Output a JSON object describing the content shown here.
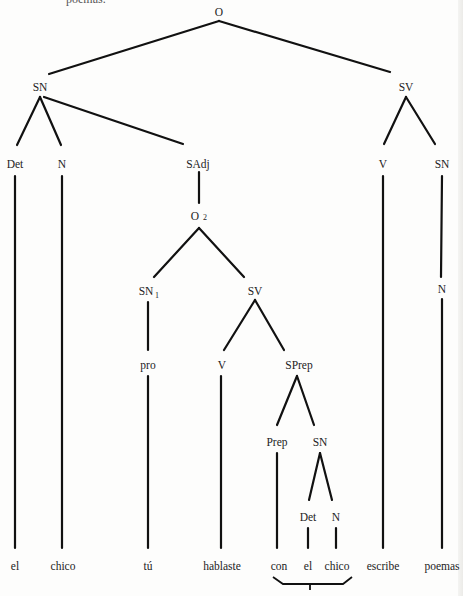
{
  "diagram": {
    "type": "syntax-tree",
    "top_fragment": "poemas.",
    "nodes": {
      "root": {
        "label": "O",
        "x": 219,
        "y": 14
      },
      "sn_main": {
        "label": "SN",
        "x": 40,
        "y": 88
      },
      "sv_main": {
        "label": "SV",
        "x": 405,
        "y": 88
      },
      "det1": {
        "label": "Det",
        "x": 15,
        "y": 165
      },
      "n1": {
        "label": "N",
        "x": 62,
        "y": 165
      },
      "sadj": {
        "label": "SAdj",
        "x": 198,
        "y": 165
      },
      "v_main": {
        "label": "V",
        "x": 382,
        "y": 165
      },
      "sn_obj": {
        "label": "SN",
        "x": 442,
        "y": 165
      },
      "o2": {
        "label": "O",
        "sub": "2",
        "x": 199,
        "y": 217
      },
      "n_obj": {
        "label": "N",
        "x": 442,
        "y": 290
      },
      "sn1": {
        "label": "SN",
        "sub": "1",
        "x": 148,
        "y": 292
      },
      "sv_inner": {
        "label": "SV",
        "x": 255,
        "y": 292
      },
      "pro": {
        "label": "pro",
        "x": 148,
        "y": 366
      },
      "v_inner": {
        "label": "V",
        "x": 222,
        "y": 366
      },
      "sprep": {
        "label": "SPrep",
        "x": 298,
        "y": 366
      },
      "prep": {
        "label": "Prep",
        "x": 277,
        "y": 443
      },
      "sn_pp": {
        "label": "SN",
        "x": 320,
        "y": 443
      },
      "det2": {
        "label": "Det",
        "x": 308,
        "y": 518
      },
      "n2": {
        "label": "N",
        "x": 336,
        "y": 518
      }
    },
    "leaves": [
      {
        "word": "el",
        "x": 15
      },
      {
        "word": "chico",
        "x": 62
      },
      {
        "word": "tú",
        "x": 148
      },
      {
        "word": "hablaste",
        "x": 222
      },
      {
        "word": "con",
        "x": 278
      },
      {
        "word": "el",
        "x": 308
      },
      {
        "word": "chico",
        "x": 336
      },
      {
        "word": "escribe",
        "x": 382
      },
      {
        "word": "poemas",
        "x": 442
      }
    ],
    "leaf_y": 568,
    "bracket": {
      "covers": [
        "con",
        "el",
        "chico"
      ]
    }
  }
}
